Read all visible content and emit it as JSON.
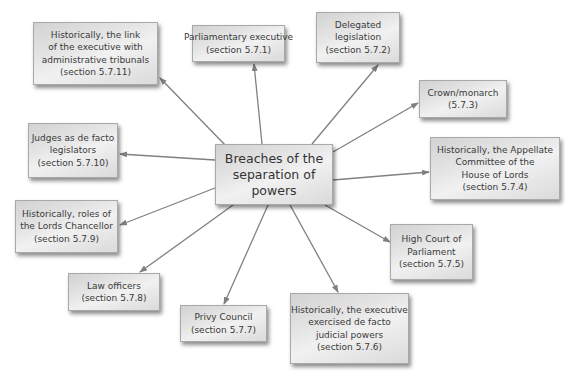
{
  "diagram": {
    "title": "Breaches of the separation of powers",
    "center": {
      "lines": [
        "Breaches of the",
        "separation of",
        "powers"
      ]
    },
    "nodes": [
      {
        "id": "parliamentary-executive",
        "lines": [
          "Parliamentary executive",
          "(section 5.7.1)"
        ],
        "section": "5.7.1"
      },
      {
        "id": "delegated-legislation",
        "lines": [
          "Delegated",
          "legislation",
          "(section 5.7.2)"
        ],
        "section": "5.7.2"
      },
      {
        "id": "crown-monarch",
        "lines": [
          "Crown/monarch",
          "(5.7.3)"
        ],
        "section": "5.7.3"
      },
      {
        "id": "appellate-committee",
        "lines": [
          "Historically, the Appellate",
          "Committee of the",
          "House of Lords",
          "(section 5.7.4)"
        ],
        "section": "5.7.4"
      },
      {
        "id": "high-court-of-parliament",
        "lines": [
          "High Court of",
          "Parliament",
          "(section 5.7.5)"
        ],
        "section": "5.7.5"
      },
      {
        "id": "executive-judicial-powers",
        "lines": [
          "Historically, the executive",
          "exercised de facto",
          "judicial powers",
          "(section 5.7.6)"
        ],
        "section": "5.7.6"
      },
      {
        "id": "privy-council",
        "lines": [
          "Privy Council",
          "(section 5.7.7)"
        ],
        "section": "5.7.7"
      },
      {
        "id": "law-officers",
        "lines": [
          "Law officers",
          "(section 5.7.8)"
        ],
        "section": "5.7.8"
      },
      {
        "id": "lords-chancellor",
        "lines": [
          "Historically, roles of",
          "the Lords Chancellor",
          "(section 5.7.9)"
        ],
        "section": "5.7.9"
      },
      {
        "id": "judges-legislators",
        "lines": [
          "Judges as de facto",
          "legislators",
          "(section 5.7.10)"
        ],
        "section": "5.7.10"
      },
      {
        "id": "executive-tribunals",
        "lines": [
          "Historically, the link",
          "of the executive with",
          "administrative tribunals",
          "(section 5.7.11)"
        ],
        "section": "5.7.11"
      }
    ],
    "colors": {
      "arrow": "#808080",
      "box_border": "#a9a9a9",
      "box_fill": "#e4e4e4",
      "text": "#3a3a3a"
    }
  }
}
